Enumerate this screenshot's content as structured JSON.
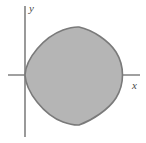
{
  "figure": {
    "title": "",
    "background_color": "#ffffff",
    "width": 146,
    "height": 143
  },
  "axes": {
    "x_axis": {
      "label": "x",
      "color": "#808080",
      "origin_x": 25,
      "origin_y": 75,
      "start_x": 8,
      "end_x": 140,
      "stroke_width": 1.6
    },
    "y_axis": {
      "label": "y",
      "color": "#808080",
      "origin_x": 25,
      "top_y": 6,
      "bottom_y": 137,
      "stroke_width": 1.6
    }
  },
  "chart_data": {
    "type": "area",
    "title": "",
    "xlabel": "x",
    "ylabel": "y",
    "legend": [],
    "grid": false,
    "region": {
      "name": "shaded-region",
      "fill_color": "#b5b5b5",
      "stroke_color": "#7a7a7a",
      "stroke_width": 1.6,
      "description": "Closed convex region with cusps at top and bottom, leftmost point at the origin and rounded right lobe",
      "key_points": {
        "leftmost": [
          25,
          75
        ],
        "top_cusp": [
          79,
          27
        ],
        "rightmost": [
          122,
          75
        ],
        "bottom_cusp": [
          79,
          125
        ]
      },
      "path": "M 25,75 C 26,58 44,37 63,30 C 70,27.5 75,26.8 79,27 C 93,30 109,41 116,52 C 121,60 122.5,68 122.5,75 C 122.5,82 121,90 116,98 C 109,109 93,120 79,125 C 75,125.2 70,124.5 63,122 C 44,115 26,92 25,75 Z"
    },
    "xlim": [
      0,
      146
    ],
    "ylim": [
      0,
      143
    ]
  }
}
